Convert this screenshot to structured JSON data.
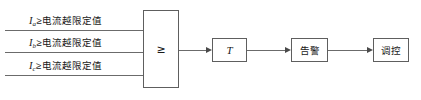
{
  "diagram": {
    "type": "logic-flow",
    "inputs": [
      {
        "symbol": "I",
        "subscript": "a",
        "operator": "≥",
        "threshold_label": "电流越限定值",
        "full_text": "Ia≥电流越限定值"
      },
      {
        "symbol": "I",
        "subscript": "b",
        "operator": "≥",
        "threshold_label": "电流越限定值",
        "full_text": "Ib≥电流越限定值"
      },
      {
        "symbol": "I",
        "subscript": "c",
        "operator": "≥",
        "threshold_label": "电流越限定值",
        "full_text": "Ic≥电流越限定值"
      }
    ],
    "blocks": {
      "comparator": {
        "label": "≥",
        "name": "or-gate"
      },
      "timer": {
        "label": "T",
        "name": "time-delay"
      },
      "alarm": {
        "label": "告警",
        "name": "alarm"
      },
      "control": {
        "label": "调控",
        "name": "dispatch-control"
      }
    },
    "colors": {
      "line": "#6b6b6b",
      "box_border": "#5e5e5e",
      "text": "#1a1a1a",
      "arrow": "#4a4a4a",
      "background": "#ffffff"
    }
  }
}
